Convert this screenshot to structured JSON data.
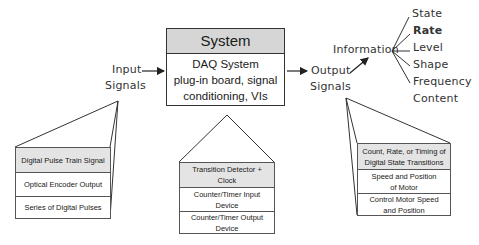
{
  "system": {
    "title": "System",
    "body_lines": [
      "DAQ System",
      "plug-in board, signal",
      "conditioning, VIs"
    ]
  },
  "input": {
    "line1": "Input",
    "line2": "Signals"
  },
  "output": {
    "line1": "Output",
    "line2": "Signals"
  },
  "information": {
    "label": "Information",
    "items": [
      "State",
      "Rate",
      "Level",
      "Shape",
      "Frequency",
      "Content"
    ],
    "bold_item": "Rate"
  },
  "input_stack": [
    "Digital Pulse Train Signal",
    "Optical Encoder Output",
    "Series of Digital Pulses"
  ],
  "system_stack": [
    "Transition Detector + Clock",
    "Counter/Timer Input Device",
    "Counter/Timer Output Device"
  ],
  "output_stack": [
    "Count, Rate, or Timing of Digital State Transitions",
    "Speed and Position of Motor",
    "Control Motor Speed and Position"
  ],
  "colors": {
    "header_fill": "#d6d6d6",
    "first_cell_fill": "#e4e4e4",
    "stroke": "#333333"
  }
}
